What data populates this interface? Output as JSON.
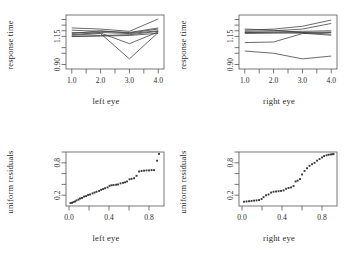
{
  "figure": {
    "background": "#ffffff",
    "line_color": "#3a3a3a",
    "axis_color": "#555555",
    "point_color": "#3a3a3a",
    "panels": 4,
    "layout": "2x2"
  },
  "chart_data": [
    {
      "id": "top-left",
      "type": "line",
      "title": "",
      "xlabel": "left eye",
      "ylabel": "response time",
      "x": [
        1,
        2,
        3,
        4
      ],
      "xlim": [
        0.8,
        4.2
      ],
      "ylim": [
        0.86,
        1.34
      ],
      "xticks": [
        1.0,
        2.0,
        3.0,
        4.0
      ],
      "xtick_labels": [
        "1.0",
        "2.0",
        "3.0",
        "4.0"
      ],
      "xminor_ticks": [
        1.5,
        2.5,
        3.5
      ],
      "yticks": [
        0.9,
        1.0,
        1.05,
        1.15,
        1.2,
        1.25,
        1.3
      ],
      "ytick_labels_shown": [
        "1.15",
        "0.90"
      ],
      "ytick_label_values": [
        1.15,
        0.9
      ],
      "grid": false,
      "legend": false,
      "series": [
        {
          "name": "subject-1",
          "values": [
            1.225,
            1.215,
            1.195,
            1.305
          ]
        },
        {
          "name": "subject-2",
          "values": [
            1.205,
            1.195,
            1.185,
            1.225
          ]
        },
        {
          "name": "subject-3",
          "values": [
            1.175,
            1.2,
            1.18,
            1.215
          ]
        },
        {
          "name": "subject-4",
          "values": [
            1.165,
            1.185,
            1.175,
            1.2
          ]
        },
        {
          "name": "subject-5",
          "values": [
            1.185,
            1.18,
            1.085,
            1.19
          ]
        },
        {
          "name": "subject-6",
          "values": [
            1.16,
            1.175,
            0.95,
            1.185
          ]
        },
        {
          "name": "subject-7",
          "values": [
            1.15,
            1.158,
            1.165,
            1.195
          ]
        },
        {
          "name": "subject-8",
          "values": [
            1.148,
            1.152,
            1.158,
            1.178
          ]
        }
      ]
    },
    {
      "id": "top-right",
      "type": "line",
      "title": "",
      "xlabel": "right eye",
      "ylabel": "response time",
      "x": [
        1,
        2,
        3,
        4
      ],
      "xlim": [
        0.8,
        4.2
      ],
      "ylim": [
        0.86,
        1.34
      ],
      "xticks": [
        1.0,
        2.0,
        3.0,
        4.0
      ],
      "xtick_labels": [
        "1.0",
        "2.0",
        "3.0",
        "4.0"
      ],
      "xminor_ticks": [
        1.5,
        2.5,
        3.5
      ],
      "yticks": [
        0.9,
        1.0,
        1.05,
        1.15,
        1.2,
        1.25,
        1.3
      ],
      "ytick_labels_shown": [
        "1.15",
        "0.90"
      ],
      "ytick_label_values": [
        1.15,
        0.9
      ],
      "grid": false,
      "legend": false,
      "series": [
        {
          "name": "subject-1",
          "values": [
            1.205,
            1.215,
            1.24,
            1.295
          ]
        },
        {
          "name": "subject-2",
          "values": [
            1.195,
            1.2,
            1.215,
            1.265
          ]
        },
        {
          "name": "subject-3",
          "values": [
            1.215,
            1.205,
            1.185,
            1.17
          ]
        },
        {
          "name": "subject-4",
          "values": [
            1.185,
            1.19,
            1.195,
            1.2
          ]
        },
        {
          "name": "subject-5",
          "values": [
            1.175,
            1.18,
            1.185,
            1.188
          ]
        },
        {
          "name": "subject-6",
          "values": [
            1.095,
            1.1,
            1.175,
            1.185
          ]
        },
        {
          "name": "subject-7",
          "values": [
            1.185,
            1.182,
            1.178,
            1.16
          ]
        },
        {
          "name": "subject-8",
          "values": [
            1.02,
            1.0,
            0.95,
            0.975
          ]
        }
      ]
    },
    {
      "id": "bottom-left",
      "type": "scatter",
      "title": "",
      "xlabel": "left eye",
      "ylabel": "uniform residuals",
      "xlim": [
        -0.03,
        0.95
      ],
      "ylim": [
        0.0,
        1.0
      ],
      "xticks": [
        0.0,
        0.4,
        0.8
      ],
      "xtick_labels": [
        "0.0",
        "0.4",
        "0.8"
      ],
      "xminor_ticks": [
        0.2,
        0.6
      ],
      "yticks": [
        0.2,
        0.8
      ],
      "ytick_labels": [
        "0.2",
        "0.8"
      ],
      "yminor_ticks": [
        0.4,
        0.6,
        1.0
      ],
      "grid": false,
      "legend": false,
      "points": [
        [
          0.015,
          0.055
        ],
        [
          0.03,
          0.06
        ],
        [
          0.045,
          0.075
        ],
        [
          0.06,
          0.085
        ],
        [
          0.075,
          0.105
        ],
        [
          0.095,
          0.12
        ],
        [
          0.11,
          0.14
        ],
        [
          0.13,
          0.15
        ],
        [
          0.15,
          0.175
        ],
        [
          0.17,
          0.185
        ],
        [
          0.19,
          0.205
        ],
        [
          0.21,
          0.215
        ],
        [
          0.235,
          0.235
        ],
        [
          0.255,
          0.25
        ],
        [
          0.275,
          0.265
        ],
        [
          0.3,
          0.28
        ],
        [
          0.32,
          0.3
        ],
        [
          0.34,
          0.315
        ],
        [
          0.36,
          0.33
        ],
        [
          0.385,
          0.345
        ],
        [
          0.405,
          0.375
        ],
        [
          0.425,
          0.385
        ],
        [
          0.445,
          0.39
        ],
        [
          0.47,
          0.395
        ],
        [
          0.49,
          0.4
        ],
        [
          0.515,
          0.42
        ],
        [
          0.54,
          0.43
        ],
        [
          0.56,
          0.44
        ],
        [
          0.58,
          0.455
        ],
        [
          0.605,
          0.495
        ],
        [
          0.625,
          0.505
        ],
        [
          0.65,
          0.515
        ],
        [
          0.675,
          0.56
        ],
        [
          0.7,
          0.64
        ],
        [
          0.725,
          0.65
        ],
        [
          0.75,
          0.655
        ],
        [
          0.775,
          0.66
        ],
        [
          0.8,
          0.66
        ],
        [
          0.825,
          0.665
        ],
        [
          0.85,
          0.665
        ],
        [
          0.88,
          0.84
        ],
        [
          0.9,
          0.965
        ]
      ]
    },
    {
      "id": "bottom-right",
      "type": "scatter",
      "title": "",
      "xlabel": "right eye",
      "ylabel": "uniform residuals",
      "xlim": [
        -0.03,
        0.95
      ],
      "ylim": [
        0.0,
        1.0
      ],
      "xticks": [
        0.0,
        0.4,
        0.8
      ],
      "xtick_labels": [
        "0.0",
        "0.4",
        "0.8"
      ],
      "xminor_ticks": [
        0.2,
        0.6
      ],
      "yticks": [
        0.2,
        0.8
      ],
      "ytick_labels": [
        "0.2",
        "0.8"
      ],
      "yminor_ticks": [
        0.4,
        0.6,
        1.0
      ],
      "grid": false,
      "legend": false,
      "points": [
        [
          0.02,
          0.08
        ],
        [
          0.045,
          0.085
        ],
        [
          0.07,
          0.09
        ],
        [
          0.095,
          0.095
        ],
        [
          0.12,
          0.1
        ],
        [
          0.145,
          0.105
        ],
        [
          0.17,
          0.11
        ],
        [
          0.195,
          0.13
        ],
        [
          0.215,
          0.165
        ],
        [
          0.24,
          0.2
        ],
        [
          0.265,
          0.215
        ],
        [
          0.29,
          0.25
        ],
        [
          0.315,
          0.265
        ],
        [
          0.34,
          0.27
        ],
        [
          0.365,
          0.275
        ],
        [
          0.39,
          0.28
        ],
        [
          0.415,
          0.29
        ],
        [
          0.44,
          0.32
        ],
        [
          0.465,
          0.335
        ],
        [
          0.49,
          0.345
        ],
        [
          0.515,
          0.37
        ],
        [
          0.535,
          0.455
        ],
        [
          0.555,
          0.47
        ],
        [
          0.58,
          0.5
        ],
        [
          0.6,
          0.585
        ],
        [
          0.625,
          0.65
        ],
        [
          0.65,
          0.7
        ],
        [
          0.675,
          0.745
        ],
        [
          0.7,
          0.775
        ],
        [
          0.725,
          0.8
        ],
        [
          0.75,
          0.84
        ],
        [
          0.775,
          0.87
        ],
        [
          0.8,
          0.9
        ],
        [
          0.82,
          0.925
        ],
        [
          0.845,
          0.94
        ],
        [
          0.865,
          0.95
        ],
        [
          0.885,
          0.955
        ],
        [
          0.9,
          0.96
        ],
        [
          0.915,
          0.962
        ]
      ]
    }
  ]
}
